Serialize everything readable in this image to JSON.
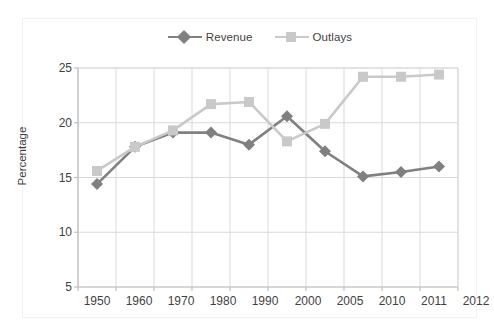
{
  "chart_data": {
    "type": "line",
    "title": "",
    "subtitle": "",
    "xlabel": "",
    "ylabel": "Percentage",
    "categories": [
      "1950",
      "1960",
      "1970",
      "1980",
      "1990",
      "2000",
      "2005",
      "2010",
      "2011",
      "2012"
    ],
    "ylim": [
      5,
      25
    ],
    "yticks": [
      5,
      10,
      15,
      20,
      25
    ],
    "grid": true,
    "legend_position": "top-center",
    "series": [
      {
        "name": "Revenue",
        "color": "#808080",
        "marker": "diamond",
        "values": [
          14.4,
          17.8,
          19.1,
          19.1,
          18.0,
          20.6,
          17.4,
          15.1,
          15.5,
          16.0
        ]
      },
      {
        "name": "Outlays",
        "color": "#c9c9c9",
        "marker": "square",
        "values": [
          15.6,
          17.8,
          19.3,
          21.7,
          21.9,
          18.3,
          19.9,
          24.2,
          24.2,
          24.4
        ]
      }
    ]
  },
  "legend": {
    "entries": [
      {
        "label": "Revenue"
      },
      {
        "label": "Outlays"
      }
    ]
  },
  "axes": {
    "y_title": "Percentage",
    "y_tick_labels": [
      "25",
      "20",
      "15",
      "10",
      "5"
    ],
    "x_tick_labels": [
      "1950",
      "1960",
      "1970",
      "1980",
      "1990",
      "2000",
      "2005",
      "2010",
      "2011",
      "2012"
    ]
  },
  "colors": {
    "revenue": "#808080",
    "outlays": "#c9c9c9",
    "grid": "#d9d9d9",
    "axis": "#bfbfbf",
    "text": "#3f3f3f",
    "background": "#ffffff"
  }
}
